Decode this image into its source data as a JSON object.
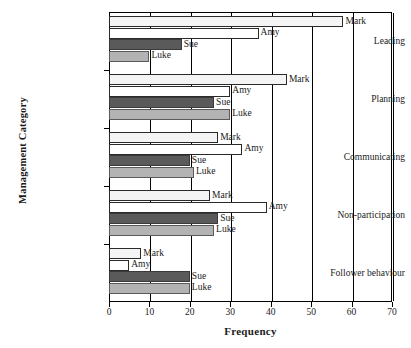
{
  "chart_data": {
    "type": "bar",
    "orientation": "horizontal",
    "title": "",
    "xlabel": "Frequency",
    "ylabel": "Management Category",
    "xlim": [
      0,
      70
    ],
    "xticks": [
      0,
      10,
      20,
      30,
      40,
      50,
      60,
      70
    ],
    "grid": true,
    "legend": "inline-labels",
    "categories": [
      "Leading",
      "Planning",
      "Communicating",
      "Non-participation",
      "Follower behaviour"
    ],
    "series": [
      {
        "name": "Mark",
        "values": [
          58,
          44,
          27,
          25,
          8
        ]
      },
      {
        "name": "Amy",
        "values": [
          37,
          30,
          33,
          39,
          5
        ]
      },
      {
        "name": "Sue",
        "values": [
          18,
          26,
          20,
          27,
          20
        ]
      },
      {
        "name": "Luke",
        "values": [
          10,
          30,
          21,
          26,
          20
        ]
      }
    ]
  },
  "axis": {
    "x_title": "Frequency",
    "y_title": "Management Category",
    "tick_labels": [
      "0",
      "10",
      "20",
      "30",
      "40",
      "50",
      "60",
      "70"
    ]
  },
  "categories": {
    "c0": "Leading",
    "c1": "Planning",
    "c2": "Communicating",
    "c3": "Non-participation",
    "c4": "Follower behaviour"
  },
  "series_names": {
    "mark": "Mark",
    "amy": "Amy",
    "sue": "Sue",
    "luke": "Luke"
  },
  "colors": {
    "mark": "#f4f4f4",
    "amy": "#ffffff",
    "sue": "#5a5a5a",
    "luke": "#b3b3b3",
    "axis": "#000000"
  }
}
